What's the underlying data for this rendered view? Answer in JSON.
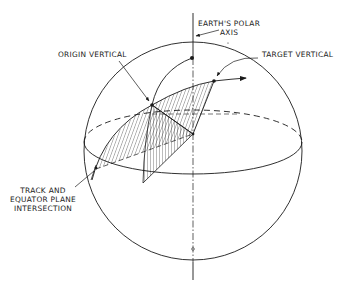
{
  "figure": {
    "type": "technical-line-drawing",
    "colors": {
      "ink": "#1a1a1a",
      "background": "#ffffff"
    }
  },
  "labels": {
    "polar_axis": "EARTH'S POLAR\nAXIS",
    "origin_vertical": "ORIGIN VERTICAL",
    "target_vertical": "TARGET VERTICAL",
    "track_intersection": "TRACK AND\nEQUATOR PLANE\nINTERSECTION"
  }
}
